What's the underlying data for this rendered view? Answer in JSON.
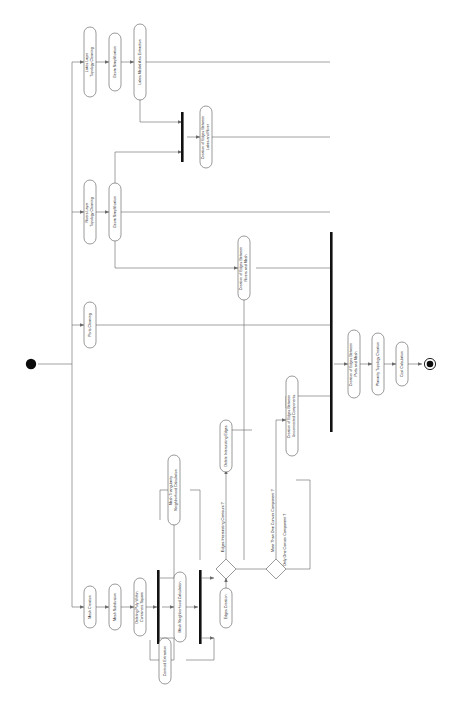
{
  "diagram": {
    "type": "uml-activity-diagram",
    "orientation": "rotated-90-clockwise",
    "colors": {
      "background": "#ffffff",
      "node_stroke": "#5b5b5b",
      "flow_stroke": "#6a6a6a",
      "bar_fill": "#111111",
      "text": "#1a1a1a"
    },
    "start_node": {
      "name": "initial-node",
      "label": ""
    },
    "end_node": {
      "name": "final-node",
      "label": ""
    },
    "activities": [
      {
        "id": "lakes_topology",
        "label": "Lakes Layer\nTopology Cleaning"
      },
      {
        "id": "geom_simpl_lakes",
        "label": "Geom Simplification"
      },
      {
        "id": "lakes_medial",
        "label": "Lakes Medial Axis Extraction"
      },
      {
        "id": "rivers_topology",
        "label": "Rivers Layer\nTopology Cleaning"
      },
      {
        "id": "geom_simpl_rivers",
        "label": "Geom Simplification"
      },
      {
        "id": "ports_cleaning",
        "label": "Ports Cleaning"
      },
      {
        "id": "edges_lakes_river",
        "label": "Creation of Edges Between\nLakes and River"
      },
      {
        "id": "edges_rivers_mesh",
        "label": "Creation of Edges Between\nRivers and Mesh"
      },
      {
        "id": "edges_unconnected",
        "label": "Creation of Edges Between\nUnconnected Components"
      },
      {
        "id": "edges_ports_mesh",
        "label": "Creation of Edges Between\nPorts and Mesh"
      },
      {
        "id": "planarity",
        "label": "Planarity Topology Creation"
      },
      {
        "id": "cost_calc",
        "label": "Cost Calculation"
      },
      {
        "id": "mesh_creation",
        "label": "Mesh Creation"
      },
      {
        "id": "mesh_subdivision",
        "label": "Mesh Subdivision"
      },
      {
        "id": "deleting_poly",
        "label": "Deleting Poly Within\nContainers Square"
      },
      {
        "id": "mesh_neighborhood",
        "label": "Mesh Neighborhood Calculation"
      },
      {
        "id": "mesh_triangularity",
        "label": "Mesh Triangularity\nNeighborhood Calculation"
      },
      {
        "id": "centroid_extraction",
        "label": "Centroid Extraction"
      },
      {
        "id": "edges_creation",
        "label": "Edges Creation"
      },
      {
        "id": "delete_intersecting",
        "label": "Delete Intersecting Edges"
      }
    ],
    "guards": [
      {
        "id": "guard_intersect",
        "label": "Edges Intersecting Contours ?"
      },
      {
        "id": "guard_more_than_one",
        "label": "More Than One Convex Component ?"
      },
      {
        "id": "guard_only_one",
        "label": "Only One Convex Component ?"
      }
    ],
    "decisions": [
      {
        "id": "decision_intersect",
        "name": "decision-edges-intersecting"
      },
      {
        "id": "decision_convex",
        "name": "decision-convex-components"
      }
    ],
    "bars": [
      {
        "id": "fork_lakes_rivers",
        "name": "join-bar-lakes-rivers"
      },
      {
        "id": "fork_mesh",
        "name": "fork-bar-mesh"
      },
      {
        "id": "join_edges",
        "name": "join-bar-edges"
      },
      {
        "id": "join_main",
        "name": "join-bar-main"
      }
    ]
  }
}
